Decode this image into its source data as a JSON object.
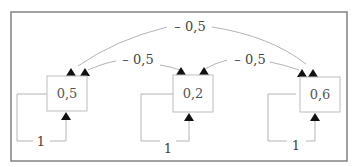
{
  "diagram": {
    "type": "network",
    "nodes": [
      {
        "id": "n1",
        "value": "0,5"
      },
      {
        "id": "n2",
        "value": "0,2"
      },
      {
        "id": "n3",
        "value": "0,6"
      }
    ],
    "edges": [
      {
        "from": "n3",
        "to": "n1",
        "weight": "– 0,5"
      },
      {
        "from": "n2",
        "to": "n1",
        "weight": "– 0,5"
      },
      {
        "from": "n2",
        "to": "n3",
        "weight": "– 0,5"
      }
    ],
    "self_loops": [
      {
        "node": "n1",
        "weight": "1"
      },
      {
        "node": "n2",
        "weight": "1"
      },
      {
        "node": "n3",
        "weight": "1"
      }
    ]
  }
}
